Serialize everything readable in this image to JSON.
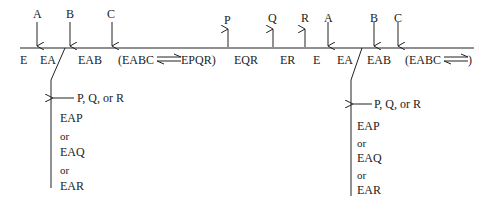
{
  "diagram": {
    "type": "reaction-mechanism-timeline",
    "top_arrows_left": [
      {
        "label": "A",
        "direction": "down",
        "x": 37
      },
      {
        "label": "B",
        "direction": "down",
        "x": 70
      },
      {
        "label": "C",
        "direction": "down",
        "x": 112
      }
    ],
    "top_arrows_right": [
      {
        "label": "P",
        "direction": "up",
        "x": 228
      },
      {
        "label": "Q",
        "direction": "up",
        "x": 273
      },
      {
        "label": "R",
        "direction": "up",
        "x": 305
      },
      {
        "label": "A",
        "direction": "down",
        "x": 328
      },
      {
        "label": "B",
        "direction": "down",
        "x": 374
      },
      {
        "label": "C",
        "direction": "down",
        "x": 398
      }
    ],
    "species_left": [
      "E",
      "EA",
      "EAB",
      "(EABC",
      "EPQR)"
    ],
    "species_right": [
      "EQR",
      "ER",
      "E",
      "EA",
      "EAB",
      "(EABC",
      ")"
    ],
    "branch_left": {
      "arrow_label": "P, Q, or R",
      "items": [
        "EAP",
        "or",
        "EAQ",
        "or",
        "EAR"
      ]
    },
    "branch_right": {
      "arrow_label": "P, Q, or R",
      "items": [
        "EAP",
        "or",
        "EAQ",
        "or",
        "EAR"
      ]
    }
  }
}
